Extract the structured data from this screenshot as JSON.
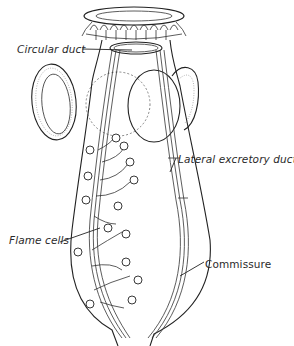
{
  "figure": {
    "labels": {
      "circular_duct": "Circular duct",
      "lateral_excretory_duct": "Lateral excretory duct",
      "flame_cells": "Flame cells",
      "commissure": "Commissure"
    },
    "colors": {
      "ink": "#222222",
      "background": "#ffffff"
    }
  }
}
